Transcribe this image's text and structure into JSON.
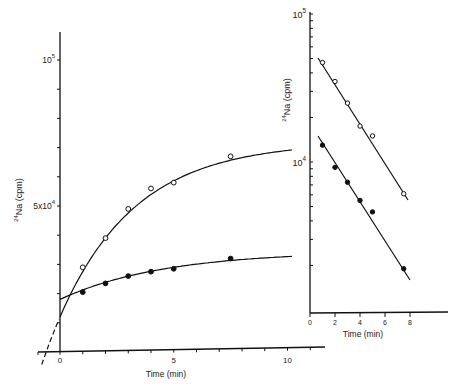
{
  "chart_data": [
    {
      "id": "main",
      "type": "line",
      "title": "",
      "xlabel": "Time (min)",
      "ylabel": "24Na (cpm)",
      "ylabel_sup": "24",
      "ylabel_main": "Na (cpm)",
      "xlim": [
        -1,
        11.5
      ],
      "ylim": [
        0,
        115000
      ],
      "yscale": "linear",
      "x_ticks": [
        0,
        1,
        2,
        3,
        4,
        5,
        6,
        7,
        8,
        9,
        10,
        11
      ],
      "x_tick_labels": {
        "0": "0",
        "5": "5",
        "10": "10"
      },
      "y_tick_labels": [
        {
          "value": 100000,
          "base": "10",
          "sup": "5"
        },
        {
          "value": 50000,
          "base": "5x10",
          "sup": "4"
        }
      ],
      "grid": false,
      "legend": null,
      "series": [
        {
          "name": "open circles",
          "marker": "open-circle",
          "x": [
            1,
            2,
            3,
            4,
            5,
            7.5
          ],
          "y": [
            29000,
            39000,
            49000,
            56000,
            58000,
            67000
          ],
          "fit_curve": "saturating exponential, extrapolated dashed to t<0 (intercept ~12000 at t=0)"
        },
        {
          "name": "filled circles",
          "marker": "filled-circle",
          "x": [
            1,
            2,
            3,
            4,
            5,
            7.5
          ],
          "y": [
            20500,
            23500,
            26000,
            27500,
            28500,
            32000
          ],
          "fit_curve": "saturating curve from ~18000 at t=0"
        }
      ]
    },
    {
      "id": "inset",
      "type": "line",
      "title": "",
      "xlabel": "Time (min)",
      "ylabel": "24Na (cpm)",
      "ylabel_sup": "24",
      "ylabel_main": "Na (cpm)",
      "yscale": "log",
      "xlim": [
        0,
        13
      ],
      "ylim": [
        1200,
        100000
      ],
      "x_ticks": [
        0,
        2,
        4,
        6,
        8
      ],
      "x_tick_labels": [
        "0",
        "2",
        "4",
        "6",
        "8"
      ],
      "y_tick_labels": [
        {
          "value": 100000,
          "base": "10",
          "sup": "5"
        },
        {
          "value": 10000,
          "base": "10",
          "sup": "4"
        }
      ],
      "grid": false,
      "legend": null,
      "series": [
        {
          "name": "open circles",
          "marker": "open-circle",
          "x": [
            1,
            2,
            3,
            4,
            5,
            7.5
          ],
          "y": [
            47000,
            35000,
            25000,
            17500,
            15000,
            6100
          ],
          "fit": "straight line on semilog"
        },
        {
          "name": "filled circles",
          "marker": "filled-circle",
          "x": [
            1,
            2,
            3,
            4,
            5,
            7.5
          ],
          "y": [
            13000,
            9200,
            7300,
            5500,
            4600,
            1900
          ],
          "fit": "straight line on semilog"
        }
      ]
    }
  ]
}
